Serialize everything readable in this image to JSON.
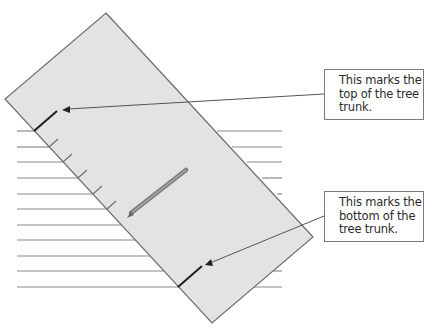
{
  "diagram": {
    "callouts": [
      {
        "id": "top",
        "lines": [
          "This marks the",
          "top of the tree",
          "trunk."
        ],
        "text": "This marks the top of the tree trunk."
      },
      {
        "id": "bottom",
        "lines": [
          "This marks the",
          "bottom of the",
          "tree trunk."
        ],
        "text": "This marks the bottom of the tree trunk."
      }
    ],
    "elements": {
      "paper": "tilted rectangular sheet of paper",
      "ruled_lines": 11,
      "tick_marks": 6,
      "pencil": "pencil lying on paper",
      "top_mark": "top of trunk mark",
      "bottom_mark": "bottom of trunk mark"
    },
    "colors": {
      "paper_fill": "#e3e3e3",
      "paper_edge": "#6e6e6e",
      "ruled_line": "#8a8a8a",
      "mark": "#1e1e1e",
      "leader": "#555555",
      "text": "#2b2b2b"
    }
  }
}
